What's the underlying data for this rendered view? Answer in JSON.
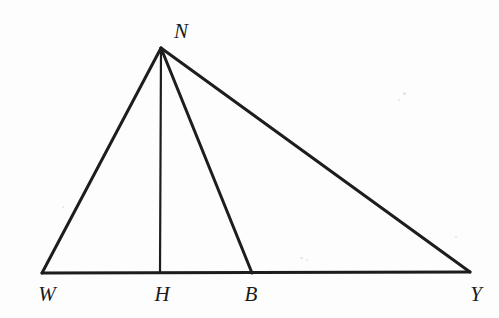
{
  "figure": {
    "kind": "geometry-diagram",
    "background_color": "#fdfdfd",
    "stroke_color": "#1d1d1d",
    "label_color": "#1b1b1b",
    "canvas": {
      "width": 499,
      "height": 318
    },
    "points": [
      {
        "id": "N",
        "label": "N",
        "x": 161,
        "y": 48,
        "label_x": 181,
        "label_y": 31
      },
      {
        "id": "W",
        "label": "W",
        "x": 42,
        "y": 273,
        "label_x": 47,
        "label_y": 294
      },
      {
        "id": "H",
        "label": "H",
        "x": 160,
        "y": 273,
        "label_x": 162,
        "label_y": 294
      },
      {
        "id": "B",
        "label": "B",
        "x": 252,
        "y": 273,
        "label_x": 251,
        "label_y": 294
      },
      {
        "id": "Y",
        "label": "Y",
        "x": 470,
        "y": 272,
        "label_x": 476,
        "label_y": 294
      }
    ],
    "segments": [
      {
        "id": "WN",
        "from": "W",
        "to": "N",
        "width": 3.0
      },
      {
        "id": "NY",
        "from": "N",
        "to": "Y",
        "width": 3.0
      },
      {
        "id": "WY",
        "from": "W",
        "to": "Y",
        "width": 3.0
      },
      {
        "id": "NH",
        "from": "N",
        "to": "H",
        "width": 2.2
      },
      {
        "id": "NB",
        "from": "N",
        "to": "B",
        "width": 3.0
      }
    ],
    "specks": [
      {
        "x": 403,
        "y": 92,
        "w": 3,
        "h": 3
      },
      {
        "x": 398,
        "y": 99,
        "w": 2,
        "h": 2
      },
      {
        "x": 300,
        "y": 257,
        "w": 3,
        "h": 2
      },
      {
        "x": 306,
        "y": 259,
        "w": 2,
        "h": 2
      },
      {
        "x": 62,
        "y": 206,
        "w": 2,
        "h": 2
      },
      {
        "x": 455,
        "y": 236,
        "w": 2,
        "h": 2
      }
    ]
  }
}
